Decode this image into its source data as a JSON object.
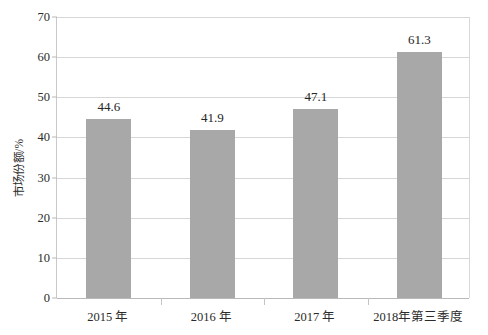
{
  "chart_data": {
    "type": "bar",
    "title": "",
    "xlabel": "",
    "ylabel": "市场份额/%",
    "ylim": [
      0,
      70
    ],
    "y_ticks": [
      0,
      10,
      20,
      30,
      40,
      50,
      60,
      70
    ],
    "y_tick_labels": [
      "0",
      "10",
      "20",
      "30",
      "40",
      "50",
      "60",
      "70"
    ],
    "grid": true,
    "legend": null,
    "categories": [
      "2015 年",
      "2016 年",
      "2017 年",
      "2018年第三季度"
    ],
    "values": [
      44.6,
      41.9,
      47.1,
      61.3
    ],
    "value_labels": [
      "44.6",
      "41.9",
      "47.1",
      "61.3"
    ],
    "bar_color": "#a8a8a8",
    "gridline_color": "#d6d6d6",
    "axis_color": "#b9b9b9",
    "text_color": "#2b2b2b"
  }
}
